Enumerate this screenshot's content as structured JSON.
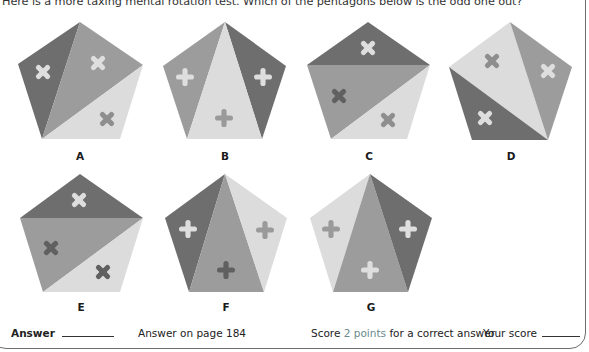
{
  "question": {
    "text": "Here is a more taxing mental rotation test. Which of the pentagons below is the odd one out?"
  },
  "colors": {
    "dark": "#6e6e6e",
    "medium": "#9c9c9c",
    "light": "#dcdcdc",
    "cross_light": "#e8e8e8",
    "cross_medium": "#8a8a8a",
    "cross_dark": "#5e5e5e",
    "accent": "#6a8a8c",
    "border": "#6d6d6d"
  },
  "options": [
    {
      "label": "A",
      "cx": 80,
      "cy": 156
    },
    {
      "label": "B",
      "cx": 225,
      "cy": 156
    },
    {
      "label": "C",
      "cx": 369,
      "cy": 156
    },
    {
      "label": "D",
      "cx": 511,
      "cy": 156
    },
    {
      "label": "E",
      "cx": 81,
      "cy": 308
    },
    {
      "label": "F",
      "cx": 226,
      "cy": 308
    },
    {
      "label": "G",
      "cx": 371,
      "cy": 308
    }
  ],
  "footer": {
    "answer_label": "Answer",
    "answer_ref": "Answer on page 184",
    "score_prefix": "Score",
    "score_points": "2 points",
    "score_suffix": "for a correct answer",
    "your_score_label": "Your score"
  }
}
